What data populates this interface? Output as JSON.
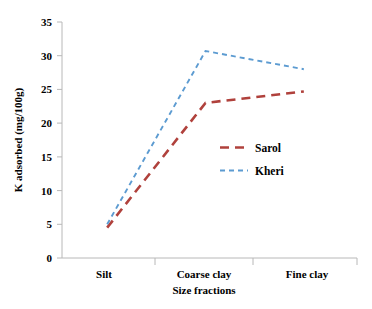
{
  "chart_data": {
    "type": "line",
    "title": "",
    "subtitle": "",
    "xlabel": "Size fractions",
    "ylabel": "K adsorbed (mg/100g)",
    "categories": [
      "Silt",
      "Coarse  clay",
      "Fine clay"
    ],
    "series": [
      {
        "name": "Sarol",
        "color": "#b0413c",
        "linestyle": "dashed",
        "values": [
          4.5,
          23.0,
          24.7
        ]
      },
      {
        "name": "Kheri",
        "color": "#5c9bd1",
        "linestyle": "dashed",
        "values": [
          5.0,
          30.7,
          28.0
        ]
      }
    ],
    "ylim": [
      0,
      35
    ],
    "yticks": [
      0,
      5,
      10,
      15,
      20,
      25,
      30,
      35
    ],
    "ytick_labels": [
      "0",
      "5",
      "10",
      "15",
      "20",
      "25",
      "30",
      "35"
    ],
    "grid": false,
    "legend_position": "center-right-inside",
    "axis_color": "#b8b8b8",
    "background": "#ffffff"
  },
  "axes": {
    "y_title": "K adsorbed (mg/100g)",
    "x_title": "Size fractions",
    "y_ticks": {
      "t0": "0",
      "t1": "5",
      "t2": "10",
      "t3": "15",
      "t4": "20",
      "t5": "25",
      "t6": "30",
      "t7": "35"
    },
    "x_ticks": {
      "c0": "Silt",
      "c1": "Coarse  clay",
      "c2": "Fine clay"
    }
  },
  "legend": {
    "items": {
      "i0": "Sarol",
      "i1": "Kheri"
    }
  }
}
